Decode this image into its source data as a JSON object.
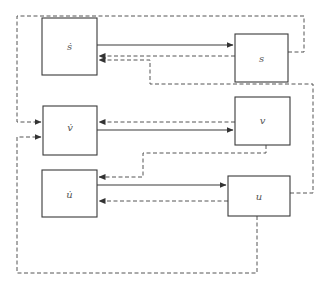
{
  "diagram": {
    "type": "block-diagram",
    "colors": {
      "line": "#3a3a3a",
      "dashed": "#555555",
      "label": "#555555",
      "background": "#ffffff"
    },
    "nodes": [
      {
        "id": "s_dot",
        "label": "ṡ"
      },
      {
        "id": "s",
        "label": "s"
      },
      {
        "id": "v_dot",
        "label": "v̇"
      },
      {
        "id": "v",
        "label": "v"
      },
      {
        "id": "u_dot",
        "label": "u̇"
      },
      {
        "id": "u",
        "label": "u"
      }
    ],
    "edges": [
      {
        "from": "s_dot",
        "to": "s",
        "style": "solid"
      },
      {
        "from": "v_dot",
        "to": "v",
        "style": "solid"
      },
      {
        "from": "u_dot",
        "to": "u",
        "style": "solid"
      },
      {
        "from": "s",
        "to": "s_dot",
        "style": "dashed"
      },
      {
        "from": "u",
        "to": "s_dot",
        "style": "dashed"
      },
      {
        "from": "s",
        "to": "v_dot",
        "style": "dashed"
      },
      {
        "from": "v",
        "to": "v_dot",
        "style": "dashed"
      },
      {
        "from": "u",
        "to": "v_dot",
        "style": "dashed"
      },
      {
        "from": "v",
        "to": "u_dot",
        "style": "dashed"
      },
      {
        "from": "u",
        "to": "u_dot",
        "style": "dashed"
      }
    ]
  }
}
